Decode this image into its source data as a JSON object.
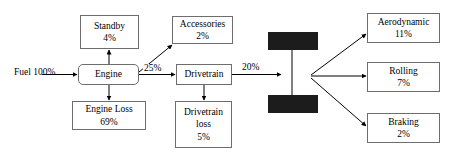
{
  "diagram": {
    "type": "block-flow-diagram",
    "stroke_color": "#6d6d6d",
    "line_color": "#000000",
    "wheel_color": "#1c1c1c",
    "background": "#ffffff",
    "source": {
      "label": "Fuel",
      "value": "100%"
    },
    "nodes": [
      {
        "id": "standby",
        "label": "Standby",
        "value": "4%"
      },
      {
        "id": "accessories",
        "label": "Accessories",
        "value": "2%"
      },
      {
        "id": "engine",
        "label": "Engine",
        "value": ""
      },
      {
        "id": "drivetrain",
        "label": "Drivetrain",
        "value": ""
      },
      {
        "id": "engine-loss",
        "label": "Engine Loss",
        "value": "69%"
      },
      {
        "id": "drivetrain-loss",
        "label": "Drivetrain",
        "label2": "loss",
        "value": "5%"
      },
      {
        "id": "aerodynamic",
        "label": "Aerodynamic",
        "value": "11%"
      },
      {
        "id": "rolling",
        "label": "Rolling",
        "value": "7%"
      },
      {
        "id": "braking",
        "label": "Braking",
        "value": "2%"
      }
    ],
    "edge_labels": [
      {
        "id": "engine-to-drivetrain",
        "text": "25%"
      },
      {
        "id": "drivetrain-to-wheels",
        "text": "20%"
      }
    ],
    "wheels": {
      "name": "vehicle-axle-wheels",
      "count": 2
    }
  }
}
